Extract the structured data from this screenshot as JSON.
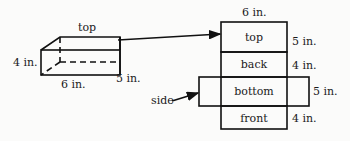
{
  "box": {
    "labels": {
      "top": "top",
      "height": "4 in.",
      "length": "6 in.",
      "width": "5 in."
    }
  },
  "net": {
    "top_dimension": "6 in.",
    "faces": [
      {
        "label": "top",
        "dimension": "5 in."
      },
      {
        "label": "back",
        "dimension": "4 in."
      },
      {
        "label": "bottom",
        "dimension": "5 in."
      },
      {
        "label": "front",
        "dimension": "4 in."
      }
    ],
    "side_label": "side"
  },
  "colors": {
    "line": "#111111",
    "background": "#fbfbfa"
  }
}
